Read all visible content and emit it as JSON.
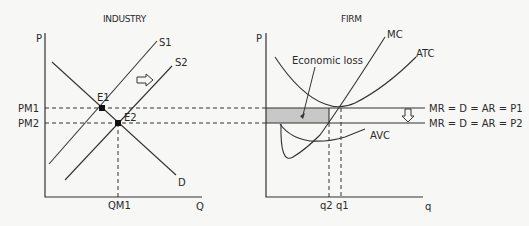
{
  "industry": {
    "title": "INDUSTRY",
    "y_axis_label": "P",
    "x_axis_label": "Q",
    "curves": {
      "supply1": "S1",
      "supply2": "S2",
      "demand": "D"
    },
    "points": {
      "e1": "E1",
      "e2": "E2"
    },
    "price_labels": {
      "pm1": "PM1",
      "pm2": "PM2"
    },
    "quantity_label": "QM1",
    "shift_arrow": "right-arrow-icon"
  },
  "firm": {
    "title": "FIRM",
    "y_axis_label": "P",
    "x_axis_label": "q",
    "curves": {
      "mc": "MC",
      "atc": "ATC",
      "avc": "AVC"
    },
    "annotation": "Economic loss",
    "revenue_lines": {
      "p1": "MR = D = AR = P1",
      "p2": "MR = D = AR = P2"
    },
    "quantity_labels": {
      "q2": "q2",
      "q1": "q1"
    },
    "shift_arrow": "down-arrow-icon"
  },
  "colors": {
    "line": "#333333",
    "loss_fill": "#c8c8c8",
    "background": "#f7f7f5"
  }
}
